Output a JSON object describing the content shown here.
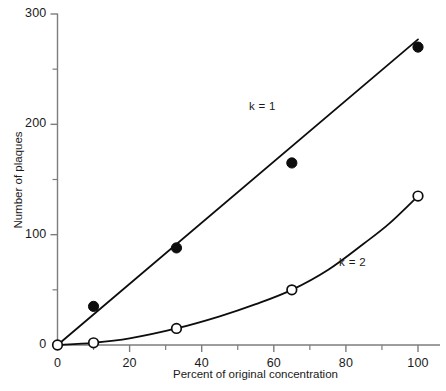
{
  "chart_data": {
    "type": "line",
    "title": "",
    "xlabel": "Percent of original concentration",
    "ylabel": "Number of plaques",
    "xlim": [
      0,
      100
    ],
    "ylim": [
      0,
      300
    ],
    "xticks": [
      0,
      20,
      40,
      60,
      80,
      100
    ],
    "xticklabels": [
      "0",
      "20",
      "40",
      "60",
      "80",
      "100"
    ],
    "xminorticks": [
      10,
      30,
      50,
      70,
      90
    ],
    "yticks": [
      0,
      100,
      200,
      300
    ],
    "yticklabels": [
      "0",
      "100",
      "200",
      "300"
    ],
    "yminorticks": [
      50,
      150,
      250
    ],
    "grid": false,
    "legend_position": "inline-annotation",
    "series": [
      {
        "name": "k = 1",
        "marker": "filled-circle",
        "annotation": "k = 1",
        "annotation_x": 57,
        "annotation_y": 215,
        "x": [
          10,
          33,
          65,
          100
        ],
        "values": [
          35,
          88,
          165,
          270
        ],
        "fit_x": [
          0,
          100
        ],
        "fit_values": [
          0,
          277
        ]
      },
      {
        "name": "k = 2",
        "marker": "open-circle",
        "annotation": "k = 2",
        "annotation_x": 82,
        "annotation_y": 73,
        "x": [
          0,
          10,
          33,
          65,
          100
        ],
        "values": [
          0,
          2,
          15,
          50,
          135
        ],
        "fit_x": [
          0,
          10,
          20,
          33,
          45,
          55,
          65,
          75,
          85,
          92,
          100
        ],
        "fit_values": [
          0,
          2,
          6,
          15,
          26,
          37,
          50,
          68,
          92,
          110,
          135
        ]
      }
    ]
  },
  "labels": {
    "y_axis_title": "Number of plaques",
    "x_axis_title": "Percent of original concentration"
  },
  "colors": {
    "axis": "#7d7d7d",
    "curve": "#0d0d0d",
    "marker_fill": "#0d0d0d",
    "marker_open_fill": "#ffffff",
    "text": "#1a1a1a"
  }
}
